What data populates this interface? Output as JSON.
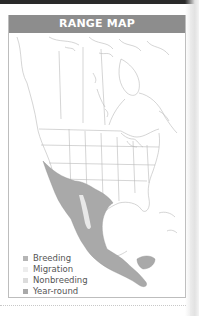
{
  "card": {
    "title": "RANGE MAP",
    "header_color": "#8d8d8d"
  },
  "map": {
    "region": "North and Central America",
    "outline_color": "#b9b9b9",
    "range_fill": "#a9a9a9"
  },
  "legend": {
    "items": [
      {
        "label": "Breeding",
        "color": "#b5b5b5"
      },
      {
        "label": "Migration",
        "color": "#ededed"
      },
      {
        "label": "Nonbreeding",
        "color": "#dcdcdc"
      },
      {
        "label": "Year-round",
        "color": "#a9a9a9"
      }
    ]
  }
}
